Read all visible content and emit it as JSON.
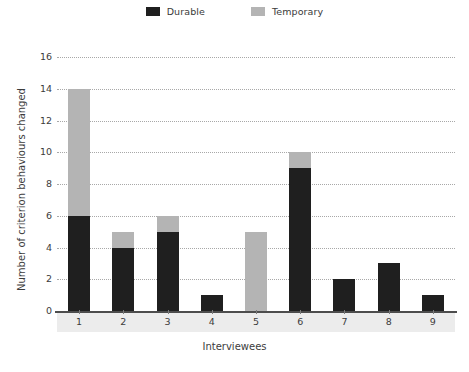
{
  "chart_data": {
    "type": "bar",
    "stacked": true,
    "title": "",
    "subtitle": "",
    "xlabel": "Interviewees",
    "ylabel": "Number of criterion behaviours changed",
    "categories": [
      "1",
      "2",
      "3",
      "4",
      "5",
      "6",
      "7",
      "8",
      "9"
    ],
    "series": [
      {
        "name": "Durable",
        "color": "#1f1f1f",
        "values": [
          6,
          4,
          5,
          1,
          0,
          9,
          2,
          3,
          1
        ]
      },
      {
        "name": "Temporary",
        "color": "#b4b4b4",
        "values": [
          8,
          1,
          1,
          0,
          5,
          1,
          0,
          0,
          0
        ]
      }
    ],
    "totals": [
      14,
      5,
      6,
      1,
      5,
      10,
      2,
      3,
      1
    ],
    "ylim": [
      0,
      16
    ],
    "ytick_values": [
      0,
      2,
      4,
      6,
      8,
      10,
      12,
      14,
      16
    ],
    "ytick_labels": [
      "0",
      "2",
      "4",
      "6",
      "8",
      "10",
      "12",
      "14",
      "16"
    ],
    "grid": true,
    "grid_axis": "y",
    "grid_style": "dotted",
    "grid_color": "#9a9a9a",
    "legend_position": "top-center",
    "background": "#ffffff",
    "axis_band_color": "#ececec"
  },
  "legend": {
    "entries": [
      {
        "label": "Durable",
        "swatch_name": "legend-swatch-durable",
        "color": "#1f1f1f"
      },
      {
        "label": "Temporary",
        "swatch_name": "legend-swatch-temporary",
        "color": "#b4b4b4"
      }
    ]
  },
  "axes": {
    "y_title": "Number of criterion behaviours changed",
    "x_title": "Interviewees"
  }
}
